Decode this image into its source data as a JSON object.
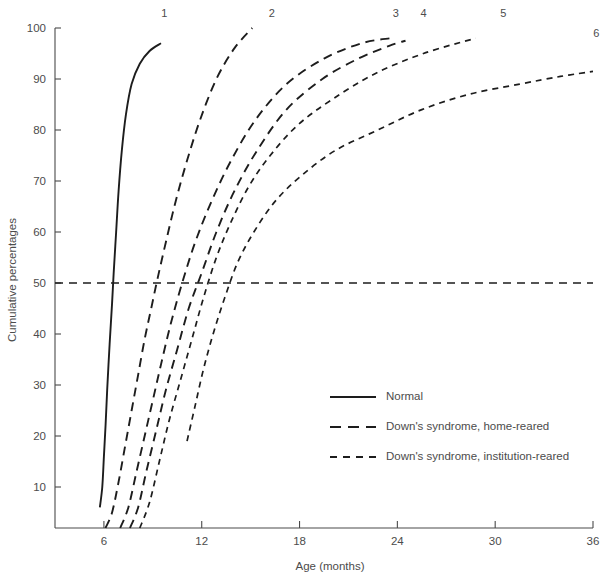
{
  "chart_data": {
    "type": "line",
    "title": "",
    "xlabel": "Age (months)",
    "ylabel": "Cumulative percentages",
    "xlim": [
      3,
      36
    ],
    "ylim": [
      0,
      100
    ],
    "xticks": [
      6,
      12,
      18,
      24,
      30,
      36
    ],
    "yticks": [
      10,
      20,
      30,
      40,
      50,
      60,
      70,
      80,
      90,
      100
    ],
    "grid": false,
    "legend_position": "center-right",
    "reference_lines": [
      {
        "axis": "y",
        "value": 50,
        "style": "dashed",
        "label": "50"
      }
    ],
    "legend": [
      {
        "key": "normal",
        "label": "Normal",
        "style": "solid"
      },
      {
        "key": "home",
        "label": "Down's syndrome, home-reared",
        "style": "dashed-long"
      },
      {
        "key": "institution",
        "label": "Down's syndrome, institution-reared",
        "style": "dashed-short"
      }
    ],
    "series": [
      {
        "name": "1",
        "group": "normal",
        "style": "solid",
        "label": "1",
        "label_x": 9.7,
        "label_y": 103,
        "points": [
          [
            5.75,
            6
          ],
          [
            5.9,
            10
          ],
          [
            6.0,
            16
          ],
          [
            6.1,
            22
          ],
          [
            6.2,
            29
          ],
          [
            6.35,
            38
          ],
          [
            6.5,
            46
          ],
          [
            6.6,
            52
          ],
          [
            6.75,
            60
          ],
          [
            6.9,
            68
          ],
          [
            7.1,
            76
          ],
          [
            7.35,
            83
          ],
          [
            7.7,
            89
          ],
          [
            8.2,
            93
          ],
          [
            8.8,
            95.5
          ],
          [
            9.5,
            97
          ]
        ]
      },
      {
        "name": "2",
        "group": "home",
        "style": "dashed-long",
        "label": "2",
        "label_x": 16.3,
        "label_y": 103,
        "points": [
          [
            6.1,
            0
          ],
          [
            6.5,
            5
          ],
          [
            6.9,
            11
          ],
          [
            7.3,
            18
          ],
          [
            7.7,
            25
          ],
          [
            8.1,
            32
          ],
          [
            8.5,
            39
          ],
          [
            8.9,
            45
          ],
          [
            9.3,
            51
          ],
          [
            9.8,
            58
          ],
          [
            10.4,
            66
          ],
          [
            11.1,
            74
          ],
          [
            11.9,
            82
          ],
          [
            12.9,
            90
          ],
          [
            14.0,
            96
          ],
          [
            15.1,
            100
          ]
        ]
      },
      {
        "name": "3",
        "group": "home",
        "style": "dashed-long",
        "label": "3",
        "label_x": 23.9,
        "label_y": 103,
        "points": [
          [
            7.0,
            0
          ],
          [
            7.5,
            6
          ],
          [
            8.0,
            13
          ],
          [
            8.5,
            20
          ],
          [
            9.0,
            27
          ],
          [
            9.5,
            34
          ],
          [
            10.1,
            42
          ],
          [
            10.8,
            50
          ],
          [
            11.6,
            58
          ],
          [
            12.6,
            66
          ],
          [
            13.8,
            74
          ],
          [
            15.3,
            82
          ],
          [
            17.2,
            89
          ],
          [
            19.5,
            94
          ],
          [
            21.8,
            97
          ],
          [
            23.6,
            98
          ]
        ]
      },
      {
        "name": "4",
        "group": "home",
        "style": "dashed-long",
        "label": "4",
        "label_x": 25.6,
        "label_y": 103,
        "points": [
          [
            7.6,
            0
          ],
          [
            8.1,
            6
          ],
          [
            8.6,
            13
          ],
          [
            9.2,
            21
          ],
          [
            9.8,
            29
          ],
          [
            10.5,
            37
          ],
          [
            11.2,
            45
          ],
          [
            12.0,
            52
          ],
          [
            12.9,
            60
          ],
          [
            14.0,
            68
          ],
          [
            15.4,
            76
          ],
          [
            17.2,
            84
          ],
          [
            19.4,
            90
          ],
          [
            21.6,
            94
          ],
          [
            23.5,
            96.5
          ],
          [
            24.5,
            97.5
          ]
        ]
      },
      {
        "name": "5",
        "group": "institution",
        "style": "dashed-short",
        "label": "5",
        "label_x": 30.5,
        "label_y": 103,
        "points": [
          [
            8.2,
            0
          ],
          [
            8.8,
            7
          ],
          [
            9.4,
            15
          ],
          [
            10.0,
            23
          ],
          [
            10.7,
            31
          ],
          [
            11.4,
            39
          ],
          [
            12.1,
            47
          ],
          [
            12.9,
            55
          ],
          [
            13.8,
            62
          ],
          [
            14.9,
            69
          ],
          [
            16.2,
            75
          ],
          [
            17.9,
            81
          ],
          [
            20.0,
            86
          ],
          [
            22.6,
            91
          ],
          [
            25.6,
            95
          ],
          [
            28.8,
            98
          ]
        ]
      },
      {
        "name": "6",
        "group": "institution",
        "style": "dashed-short",
        "label": "6",
        "label_x": 36.2,
        "label_y": 99,
        "points": [
          [
            11.1,
            19
          ],
          [
            11.6,
            26
          ],
          [
            12.1,
            33
          ],
          [
            12.7,
            40
          ],
          [
            13.4,
            47
          ],
          [
            14.2,
            54
          ],
          [
            15.2,
            60
          ],
          [
            16.5,
            66
          ],
          [
            18.1,
            71
          ],
          [
            20.2,
            76
          ],
          [
            22.8,
            80
          ],
          [
            25.5,
            84
          ],
          [
            28.4,
            87
          ],
          [
            31.5,
            89
          ],
          [
            34.0,
            90.5
          ],
          [
            36.0,
            91.5
          ]
        ]
      }
    ]
  },
  "legend_block": {
    "items": [
      {
        "label": "Normal"
      },
      {
        "label": "Down's syndrome, home-reared"
      },
      {
        "label": "Down's syndrome, institution-reared"
      }
    ]
  }
}
